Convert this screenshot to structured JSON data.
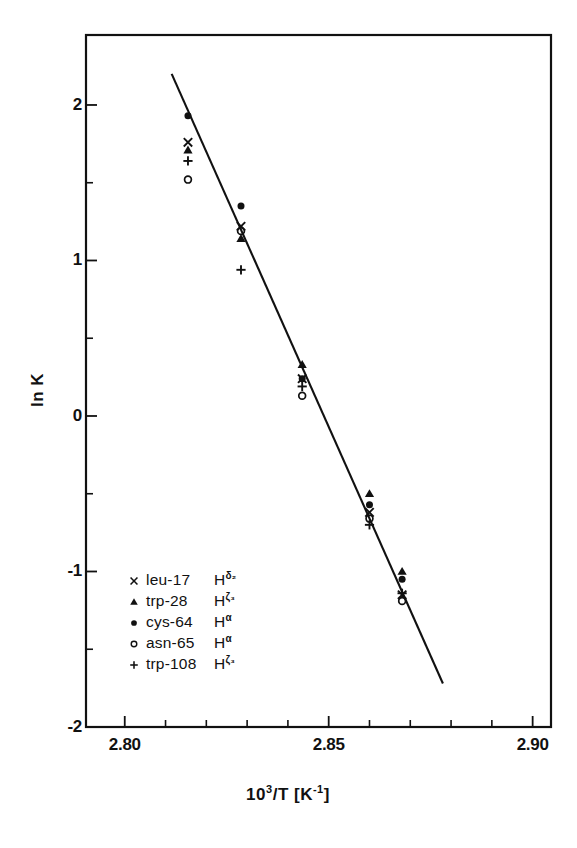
{
  "chart_data": {
    "type": "scatter",
    "title": "",
    "subtitle": "",
    "xlabel": "10³/T  [K⁻¹]",
    "ylabel": "ln K",
    "xlim": [
      2.7905,
      2.9045
    ],
    "ylim": [
      -2.0,
      2.45
    ],
    "grid": false,
    "legend_position": "lower-left-inside",
    "x_ticks_major": [
      2.8,
      2.85,
      2.9
    ],
    "x_ticks_major_labels": [
      "2.80",
      "2.85",
      "2.90"
    ],
    "x_ticks_minor": [
      2.81,
      2.82,
      2.83,
      2.84,
      2.86,
      2.87,
      2.88,
      2.89
    ],
    "y_ticks_major": [
      2,
      1,
      0,
      -1,
      -2
    ],
    "y_ticks_major_labels": [
      "2",
      "1",
      "0",
      "-1",
      "-2"
    ],
    "y_ticks_minor": [
      1.5,
      0.5,
      -0.5,
      -1.5
    ],
    "fit_line": {
      "label": "linear regression",
      "x": [
        2.8115,
        2.878
      ],
      "y": [
        2.2,
        -1.72
      ]
    },
    "series": [
      {
        "name": "leu-17 Hδ₂",
        "residue": "leu-17",
        "proton": "H",
        "proton_sup": "δ₂",
        "marker": "cross",
        "x": [
          2.8155,
          2.8285,
          2.8435,
          2.86,
          2.868
        ],
        "y": [
          1.76,
          1.22,
          0.24,
          -0.62,
          -1.15
        ]
      },
      {
        "name": "trp-28 Hζ₃",
        "residue": "trp-28",
        "proton": "H",
        "proton_sup": "ζ₃",
        "marker": "filled-triangle",
        "x": [
          2.8155,
          2.8285,
          2.8435,
          2.86,
          2.868
        ],
        "y": [
          1.71,
          1.14,
          0.33,
          -0.5,
          -1.0
        ]
      },
      {
        "name": "cys-64 Hα",
        "residue": "cys-64",
        "proton": "H",
        "proton_sup": "α",
        "marker": "filled-circle",
        "x": [
          2.8155,
          2.8285,
          2.8435,
          2.86,
          2.868
        ],
        "y": [
          1.93,
          1.35,
          0.24,
          -0.57,
          -1.05
        ]
      },
      {
        "name": "asn-65 Hα",
        "residue": "asn-65",
        "proton": "H",
        "proton_sup": "α",
        "marker": "open-circle",
        "x": [
          2.8155,
          2.8285,
          2.8435,
          2.86,
          2.868
        ],
        "y": [
          1.52,
          1.19,
          0.13,
          -0.66,
          -1.19
        ]
      },
      {
        "name": "trp-108 Hζ₃",
        "residue": "trp-108",
        "proton": "H",
        "proton_sup": "ζ₃",
        "marker": "plus",
        "x": [
          2.8155,
          2.8285,
          2.8435,
          2.86,
          2.868
        ],
        "y": [
          1.64,
          0.94,
          0.19,
          -0.7,
          -1.14
        ]
      }
    ]
  },
  "axes": {
    "x_title_mantissa": "10",
    "x_title_exponent": "3",
    "x_title_rest": "/T  [K",
    "x_title_unit_exponent": "-1",
    "x_title_close": "]",
    "y_title": "ln K"
  },
  "legend": {
    "rows": [
      {
        "marker": "cross",
        "residue": "leu-17",
        "proton": "H",
        "sup": "δ₂"
      },
      {
        "marker": "filled-triangle",
        "residue": "trp-28",
        "proton": "H",
        "sup": "ζ₃"
      },
      {
        "marker": "filled-circle",
        "residue": "cys-64",
        "proton": "H",
        "sup": "α"
      },
      {
        "marker": "open-circle",
        "residue": "asn-65",
        "proton": "H",
        "sup": "α"
      },
      {
        "marker": "plus",
        "residue": "trp-108",
        "proton": "H",
        "sup": "ζ₃"
      }
    ]
  },
  "style": {
    "ink": "#111111",
    "background": "#ffffff"
  }
}
